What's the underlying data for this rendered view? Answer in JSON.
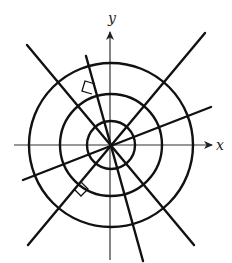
{
  "diagram": {
    "center": {
      "x": 111,
      "y": 145
    },
    "stroke_color": "#111111",
    "axis_color": "#333333",
    "axes": {
      "x": {
        "label": "x",
        "start": [
          14,
          145
        ],
        "end": [
          212,
          145
        ],
        "label_pos": [
          216,
          150
        ]
      },
      "y": {
        "label": "y",
        "start": [
          110,
          260
        ],
        "end": [
          110,
          32
        ],
        "label_pos": [
          108,
          23
        ]
      }
    },
    "circles": [
      {
        "name": "inner-circle",
        "r": 24
      },
      {
        "name": "middle-circle",
        "r": 51
      },
      {
        "name": "outer-circle",
        "r": 82
      }
    ],
    "lines": [
      {
        "name": "ray-line-ne-sw",
        "x1": 205,
        "y1": 33,
        "x2": 28,
        "y2": 245
      },
      {
        "name": "ray-line-ene-wsw",
        "x1": 211,
        "y1": 107,
        "x2": 23,
        "y2": 180
      },
      {
        "name": "ray-line-nw-se",
        "x1": 27,
        "y1": 45,
        "x2": 194,
        "y2": 245
      },
      {
        "name": "ray-line-nnw-sse",
        "x1": 86,
        "y1": 56,
        "x2": 143,
        "y2": 261
      }
    ],
    "right_angle_markers": [
      {
        "name": "right-angle-marker-upper",
        "points": "92,94 82,91 85,81 95,84"
      },
      {
        "name": "right-angle-marker-lower",
        "points": "74,189 81,196 88,189 81,182"
      }
    ]
  }
}
